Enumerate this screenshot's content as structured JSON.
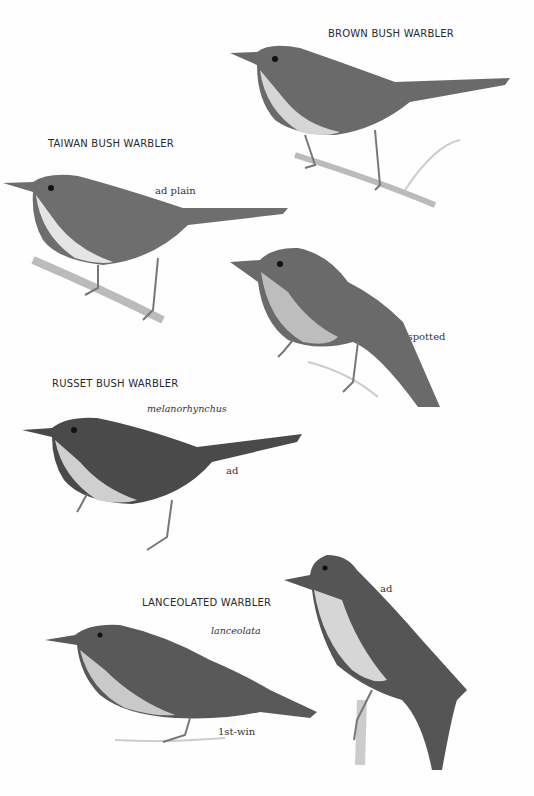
{
  "plate": {
    "species": [
      {
        "name": "BROWN BUSH WARBLER",
        "forms": [
          {
            "label": ""
          }
        ]
      },
      {
        "name": "TAIWAN BUSH WARBLER",
        "forms": [
          {
            "label": "ad plain"
          },
          {
            "label": "ad spotted"
          }
        ]
      },
      {
        "name": "RUSSET BUSH WARBLER",
        "subspecies": "melanorhynchus",
        "forms": [
          {
            "label": "ad"
          }
        ]
      },
      {
        "name": "LANCEOLATED WARBLER",
        "subspecies": "lanceolata",
        "forms": [
          {
            "label": "ad"
          },
          {
            "label": "1st-win"
          }
        ]
      }
    ]
  },
  "colors": {
    "background": "#ffffff",
    "plumage_dark": "#3a3a3a",
    "plumage_mid": "#6e6e6e",
    "plumage_light": "#c8c8c8",
    "text": "#2a2a2a"
  }
}
